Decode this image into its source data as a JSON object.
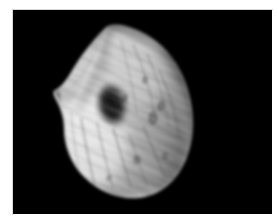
{
  "image": {
    "kind": "grayscale-medical-scan",
    "title": "Grayscale Scan Image",
    "width_px": 279,
    "height_px": 224,
    "frame_color": "#ffffff",
    "canvas": {
      "background_color": "#000000",
      "left_px": 13,
      "top_px": 10,
      "width_px": 259,
      "height_px": 204
    },
    "subject": {
      "name": "curved-lobed-specimen",
      "description": "Bright curved bean/kidney shaped structure on black background with fine diagonal striated texture",
      "bounds": {
        "x": 55,
        "y": 28,
        "width": 135,
        "height": 170
      },
      "apex_point": {
        "x": 105,
        "y": 30
      },
      "bottom_tip": {
        "x": 140,
        "y": 197
      },
      "central_notch": {
        "x": 115,
        "y": 95
      },
      "left_shoulder_notch": {
        "x": 58,
        "y": 85
      }
    },
    "tones": {
      "highlight": "#ececec",
      "bright": "#d6d6d6",
      "midtone": "#b2b2b2",
      "shadow": "#6e6e6e",
      "deep_shadow": "#2e2e2e",
      "background": "#000000"
    }
  },
  "chart_data": {
    "type": "heatmap",
    "xlabel": "",
    "ylabel": "",
    "colormap": "grayscale",
    "value_range": [
      0,
      255
    ]
  }
}
